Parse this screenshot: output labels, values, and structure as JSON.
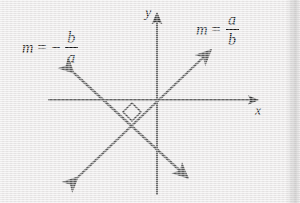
{
  "figure": {
    "name": "perpendicular-slopes-diagram",
    "background_color": "#eceaea",
    "stroke_color": "#595959",
    "text_color": "#121212"
  },
  "axes": {
    "x_label": "x",
    "y_label": "y",
    "origin": [
      157,
      100
    ],
    "x_axis": {
      "from": [
        48,
        100
      ],
      "to": [
        262,
        100
      ],
      "arrow": "end"
    },
    "y_axis": {
      "from": [
        157,
        195
      ],
      "to": [
        157,
        8
      ],
      "arrow": "end"
    }
  },
  "lines": [
    {
      "name": "positive-slope-line",
      "slope_label": "m = a/b",
      "direction": "up-right",
      "from": [
        72,
        182
      ],
      "to": [
        216,
        45
      ],
      "arrows": "both"
    },
    {
      "name": "negative-slope-line",
      "slope_label": "m = -b/a",
      "direction": "down-right",
      "from": [
        68,
        68
      ],
      "to": [
        193,
        183
      ],
      "arrows": "both"
    }
  ],
  "right_angle_marker": {
    "name": "right-angle-marker",
    "center": [
      132,
      112
    ],
    "size": 9
  },
  "labels": {
    "positive_slope": {
      "m": "m",
      "equals": "=",
      "numerator": "a",
      "denominator": "b"
    },
    "negative_slope": {
      "m": "m",
      "equals": "=",
      "minus": "−",
      "numerator": "b",
      "denominator": "a"
    }
  }
}
